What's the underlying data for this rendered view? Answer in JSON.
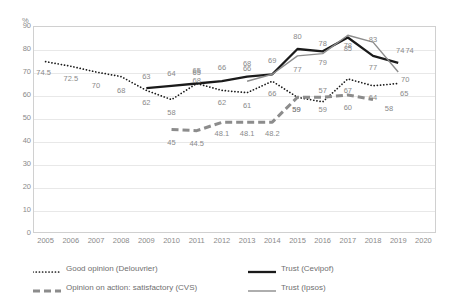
{
  "chart_data": {
    "type": "line",
    "title": "",
    "subtitle": "",
    "xlabel": "",
    "ylabel": "",
    "unit_label": "%",
    "grid": true,
    "legend_position": "bottom",
    "xlim": [
      2005,
      2020
    ],
    "ylim": [
      0,
      90
    ],
    "ytick_step": 10,
    "categories": [
      2005,
      2006,
      2007,
      2008,
      2009,
      2010,
      2011,
      2012,
      2013,
      2014,
      2015,
      2016,
      2017,
      2018,
      2019,
      2020
    ],
    "xticks": [
      "2005",
      "2006",
      "2007",
      "2008",
      "2009",
      "2010",
      "2011",
      "2012",
      "2013",
      "2014",
      "2015",
      "2016",
      "2017",
      "2018",
      "2019",
      "2020"
    ],
    "yticks": [
      "0",
      "10",
      "20",
      "30",
      "40",
      "50",
      "60",
      "70",
      "80",
      "90"
    ],
    "series": [
      {
        "name": "Good opinion (Delouvrier)",
        "style": "dotted",
        "color": "#1a1a1a",
        "points": [
          {
            "x": 2005,
            "y": 74.5,
            "label": "74.5",
            "lx": -2,
            "ly": 11
          },
          {
            "x": 2006,
            "y": 72.5,
            "label": "72.5",
            "lx": 0,
            "ly": 13
          },
          {
            "x": 2007,
            "y": 70,
            "label": "70",
            "lx": 0,
            "ly": 14
          },
          {
            "x": 2008,
            "y": 68,
            "label": "68",
            "lx": 0,
            "ly": 14
          },
          {
            "x": 2009,
            "y": 62,
            "label": "62",
            "lx": 0,
            "ly": 13
          },
          {
            "x": 2010,
            "y": 58,
            "label": "58",
            "lx": 0,
            "ly": 13
          },
          {
            "x": 2011,
            "y": 65,
            "label": "65",
            "lx": 0,
            "ly": -11
          },
          {
            "x": 2012,
            "y": 62,
            "label": "62",
            "lx": 0,
            "ly": 13
          },
          {
            "x": 2013,
            "y": 61,
            "label": "61",
            "lx": 0,
            "ly": 13
          },
          {
            "x": 2014,
            "y": 66,
            "label": "66",
            "lx": 0,
            "ly": 13
          },
          {
            "x": 2015,
            "y": 59,
            "label": "59",
            "lx": -1,
            "ly": 13
          },
          {
            "x": 2016,
            "y": 57,
            "label": "57",
            "lx": 0,
            "ly": -11
          },
          {
            "x": 2017,
            "y": 67,
            "label": "67",
            "lx": 0,
            "ly": 12
          },
          {
            "x": 2018,
            "y": 64,
            "label": "64",
            "lx": 0,
            "ly": 12
          },
          {
            "x": 2019,
            "y": 65,
            "label": "65",
            "lx": 6,
            "ly": 10
          }
        ]
      },
      {
        "name": "Trust (Cevipof)",
        "style": "solid-thick",
        "color": "#1a1a1a",
        "points": [
          {
            "x": 2009,
            "y": 63,
            "label": "63",
            "lx": 0,
            "ly": -11
          },
          {
            "x": 2010,
            "y": 64,
            "label": "64",
            "lx": 0,
            "ly": -12
          },
          {
            "x": 2011,
            "y": 65,
            "label": "65",
            "lx": 0,
            "ly": -13
          },
          {
            "x": 2012,
            "y": 66,
            "label": "66",
            "lx": 0,
            "ly": -13
          },
          {
            "x": 2013,
            "y": 68,
            "label": "68",
            "lx": 0,
            "ly": -13
          },
          {
            "x": 2014,
            "y": 69,
            "label": "69",
            "lx": 0,
            "ly": -13
          },
          {
            "x": 2015,
            "y": 80,
            "label": "80",
            "lx": 0,
            "ly": -12
          },
          {
            "x": 2016,
            "y": 79,
            "label": "79",
            "lx": 0,
            "ly": 12
          },
          {
            "x": 2017,
            "y": 85,
            "label": "85",
            "lx": 0,
            "ly": 11
          },
          {
            "x": 2018,
            "y": 77,
            "label": "77",
            "lx": 0,
            "ly": 12
          },
          {
            "x": 2019,
            "y": 74,
            "label": "74",
            "lx": 2,
            "ly": -12
          }
        ]
      },
      {
        "name": "Opinion on action: satisfactory (CVS)",
        "style": "dashed-thick",
        "color": "#8c8c8c",
        "points": [
          {
            "x": 2010,
            "y": 45,
            "label": "45",
            "lx": 0,
            "ly": 13
          },
          {
            "x": 2011,
            "y": 44.5,
            "label": "44.5",
            "lx": 0,
            "ly": 13
          },
          {
            "x": 2012,
            "y": 48.1,
            "label": "48.1",
            "lx": 0,
            "ly": 12
          },
          {
            "x": 2013,
            "y": 48.1,
            "label": "48.1",
            "lx": 0,
            "ly": 12
          },
          {
            "x": 2014,
            "y": 48.2,
            "label": "48.2",
            "lx": 0,
            "ly": 12
          },
          {
            "x": 2015,
            "y": 59,
            "label": "59",
            "lx": -1,
            "ly": 13
          },
          {
            "x": 2016,
            "y": 59,
            "label": "59",
            "lx": 0,
            "ly": 13
          },
          {
            "x": 2017,
            "y": 60,
            "label": "60",
            "lx": 0,
            "ly": 13
          },
          {
            "x": 2018,
            "y": 58,
            "label": "58",
            "lx": 16,
            "ly": 9
          }
        ]
      },
      {
        "name": "Trust (Ipsos)",
        "style": "solid-thin",
        "color": "#8c8c8c",
        "points": [
          {
            "x": 2013,
            "y": 66,
            "label": "66",
            "lx": 0,
            "ly": -12
          },
          {
            "x": 2014,
            "y": 69,
            "label": "",
            "lx": 0,
            "ly": -12
          },
          {
            "x": 2015,
            "y": 77,
            "label": "77",
            "lx": 0,
            "ly": 14
          },
          {
            "x": 2016,
            "y": 78,
            "label": "78",
            "lx": 0,
            "ly": -10
          },
          {
            "x": 2017,
            "y": 86,
            "label": "78",
            "lx": 0,
            "ly": 11
          },
          {
            "x": 2018,
            "y": 83,
            "label": "83",
            "lx": 0,
            "ly": -2
          },
          {
            "x": 2019,
            "y": 70,
            "label": "70",
            "lx": 7,
            "ly": 8
          }
        ]
      }
    ],
    "extra_labels": [
      {
        "text": "68",
        "x": 2011,
        "y": 66,
        "owner": "delouvrier-secondary"
      },
      {
        "text": "74",
        "x": 2019.45,
        "y": 79,
        "owner": "cevipof-end"
      }
    ]
  },
  "legend": {
    "items": [
      {
        "label": "Good opinion (Delouvrier)",
        "style": "dotted",
        "color": "#1a1a1a"
      },
      {
        "label": "Trust (Cevipof)",
        "style": "solid-thick",
        "color": "#1a1a1a"
      },
      {
        "label": "Opinion on action: satisfactory (CVS)",
        "style": "dashed-thick",
        "color": "#8c8c8c"
      },
      {
        "label": "Trust (Ipsos)",
        "style": "solid-thin",
        "color": "#8c8c8c"
      }
    ]
  }
}
